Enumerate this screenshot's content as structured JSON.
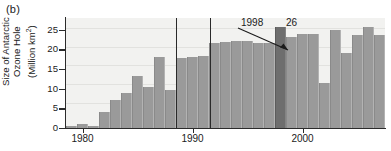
{
  "panel": {
    "label": "(b)"
  },
  "axes": {
    "ytitle_line1": "Size of Antarctic",
    "ytitle_line2": "Ozone Hole",
    "ytitle_line3": "(Million km",
    "ytitle_sup": "2",
    "ytitle_close": ")",
    "yticks": [
      "0",
      "5",
      "10",
      "15",
      "20",
      "25"
    ],
    "xticks": [
      "1980",
      "1990",
      "2000"
    ]
  },
  "annotations": {
    "year_callout": "1998",
    "peak_value": "26"
  },
  "colors": {
    "bar": "#9a9a9a",
    "bar_highlight": "#6e6e6e",
    "plot_background": "#f2f2f0",
    "axis": "#2b2b2b",
    "gridline": "#e2e2df"
  },
  "chart_data": {
    "type": "bar",
    "title": "",
    "xlabel": "",
    "ylabel": "Size of Antarctic Ozone Hole (Million km2)",
    "ylim": [
      0,
      28
    ],
    "xlim": [
      1978.5,
      2007.5
    ],
    "ytick_values": [
      0,
      5,
      10,
      15,
      20,
      25
    ],
    "xtick_values": [
      1980,
      1990,
      2000
    ],
    "grid": true,
    "legend": "none",
    "categories": [
      1979,
      1980,
      1981,
      1982,
      1983,
      1984,
      1985,
      1986,
      1987,
      1988,
      1989,
      1990,
      1991,
      1992,
      1993,
      1994,
      1995,
      1996,
      1997,
      1998,
      1999,
      2000,
      2001,
      2002,
      2003,
      2004,
      2005,
      2006,
      2007
    ],
    "values": [
      0.4,
      1.1,
      0.6,
      4.1,
      7.1,
      9.0,
      13.2,
      10.5,
      18.2,
      9.7,
      17.8,
      18.2,
      18.3,
      21.6,
      22.0,
      22.1,
      22.1,
      21.7,
      21.7,
      25.7,
      23.1,
      23.9,
      23.9,
      11.4,
      25.0,
      19.2,
      23.8,
      25.6,
      23.8
    ],
    "highlight_category": 1998,
    "highlight_value": 26,
    "annotations": [
      {
        "text": "1998",
        "target_category": 1998
      },
      {
        "text": "26",
        "target_category": 1998,
        "target_value": 26
      }
    ],
    "marker_lines": [
      1995.5,
      1998.5
    ]
  }
}
